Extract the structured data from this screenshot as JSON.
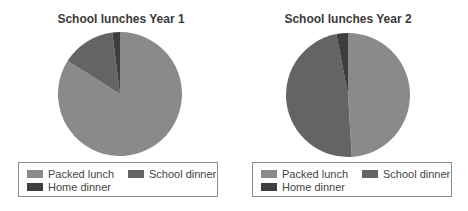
{
  "colors": {
    "packed_lunch": "#8a8a8a",
    "school_dinner": "#646464",
    "home_dinner": "#3e3e3e"
  },
  "charts": [
    {
      "title": "School lunches Year 1",
      "legend": [
        "Packed lunch",
        "School dinner",
        "Home dinner"
      ]
    },
    {
      "title": "School lunches Year 2",
      "legend": [
        "Packed lunch",
        "School dinner",
        "Home dinner"
      ]
    }
  ],
  "chart_data": [
    {
      "type": "pie",
      "title": "School lunches Year 1",
      "categories": [
        "Packed lunch",
        "School dinner",
        "Home dinner"
      ],
      "values": [
        84,
        14,
        2
      ],
      "start_angle": "12 o'clock",
      "direction": "clockwise",
      "legend_position": "bottom"
    },
    {
      "type": "pie",
      "title": "School lunches Year 2",
      "categories": [
        "Packed lunch",
        "School dinner",
        "Home dinner"
      ],
      "values": [
        49,
        48,
        3
      ],
      "start_angle": "12 o'clock",
      "direction": "clockwise",
      "legend_position": "bottom"
    }
  ]
}
